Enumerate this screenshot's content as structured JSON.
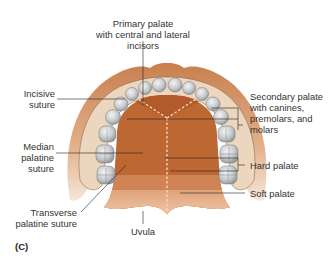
{
  "figure": {
    "panel_label": "(C)",
    "labels": {
      "primary_palate": [
        "Primary palate",
        "with central and lateral incisors"
      ],
      "incisive_suture": [
        "Incisive",
        "suture"
      ],
      "secondary_palate": [
        "Secondary palate",
        "with canines,",
        "premolars, and",
        "molars"
      ],
      "median_palatine_suture": [
        "Median",
        "palatine",
        "suture"
      ],
      "hard_palate": "Hard palate",
      "soft_palate": "Soft palate",
      "transverse_palatine_suture": [
        "Transverse",
        "palatine suture"
      ],
      "uvula": "Uvula"
    },
    "colors": {
      "lip_outer": "#d99a6c",
      "gum": "#ecd3b8",
      "palate_primary": "#b9612f",
      "palate_secondary": "#c06a35",
      "palate_hard_posterior": "#d4895a",
      "soft_palate": "#e6b48e",
      "tooth": "#c8cbcf",
      "suture_dash": "#f5d9b8",
      "leader_line": "#222222"
    }
  }
}
